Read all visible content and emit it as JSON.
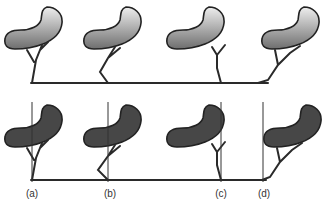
{
  "figure": {
    "colors": {
      "top_fill_light": "#e8e8e8",
      "top_fill_dark": "#7a7a7a",
      "bottom_fill": "#474747",
      "outline": "#222222",
      "line": "#2a2a2a"
    },
    "panels": [
      {
        "label": "(a)",
        "x": 32
      },
      {
        "label": "(b)",
        "x": 108
      },
      {
        "label": "(c)",
        "x": 221
      },
      {
        "label": "(d)",
        "x": 263
      }
    ]
  }
}
